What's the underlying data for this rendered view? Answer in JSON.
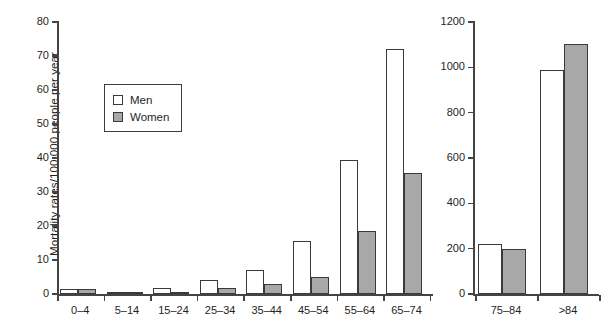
{
  "figure": {
    "ylabel_left": "Mortality rates/100 000 people per year",
    "caption": ""
  },
  "legend": {
    "title": "",
    "items": [
      {
        "key": "men",
        "label": "Men",
        "color": "#ffffff"
      },
      {
        "key": "women",
        "label": "Women",
        "color": "#a8a8a8"
      }
    ]
  },
  "left_axis": {
    "ticks": [
      "0",
      "10",
      "20",
      "30",
      "40",
      "50",
      "60",
      "70",
      "80"
    ],
    "min": 0,
    "max": 80
  },
  "right_axis": {
    "ticks": [
      "0",
      "200",
      "400",
      "600",
      "800",
      "1000",
      "1200"
    ],
    "min": 0,
    "max": 1200
  },
  "left_categories": [
    "0–4",
    "5–14",
    "15–24",
    "25–34",
    "35–44",
    "45–54",
    "55–64",
    "65–74"
  ],
  "right_categories": [
    "75–84",
    ">84"
  ],
  "chart_data": {
    "type": "bar",
    "title": "",
    "xlabel": "",
    "ylabel": "Mortality rates/100 000 people per year",
    "grid": false,
    "legend_position": "inside-upper-left",
    "panels": [
      {
        "name": "left-panel",
        "ylim": [
          0,
          80
        ],
        "yticks": [
          0,
          10,
          20,
          30,
          40,
          50,
          60,
          70,
          80
        ],
        "categories": [
          "0–4",
          "5–14",
          "15–24",
          "25–34",
          "35–44",
          "45–54",
          "55–64",
          "65–74"
        ],
        "series": [
          {
            "name": "Men",
            "values": [
              1.5,
              0.2,
              1.8,
              4.0,
              7.1,
              15.6,
              39.4,
              72.0
            ]
          },
          {
            "name": "Women",
            "values": [
              1.4,
              0.2,
              0.7,
              1.9,
              2.9,
              4.9,
              18.5,
              35.5
            ]
          }
        ]
      },
      {
        "name": "right-panel",
        "ylim": [
          0,
          1200
        ],
        "yticks": [
          0,
          200,
          400,
          600,
          800,
          1000,
          1200
        ],
        "categories": [
          "75–84",
          ">84"
        ],
        "series": [
          {
            "name": "Men",
            "values": [
              220,
              990
            ]
          },
          {
            "name": "Women",
            "values": [
              200,
              1105
            ]
          }
        ]
      }
    ]
  }
}
